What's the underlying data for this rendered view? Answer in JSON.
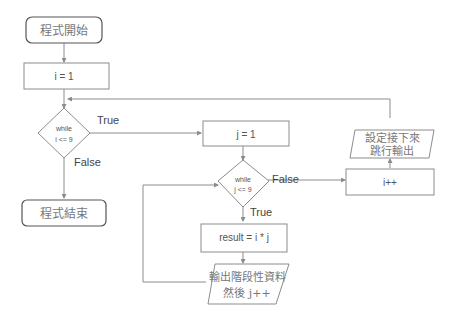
{
  "diagram": {
    "nodes": {
      "start": {
        "label": "程式開始",
        "shape": "rounded-rect"
      },
      "init_i": {
        "label": "i = 1",
        "shape": "rect"
      },
      "cond_i": {
        "line1": "while",
        "line2": "i <= 9",
        "shape": "diamond"
      },
      "end": {
        "label": "程式結束",
        "shape": "rounded-rect"
      },
      "init_j": {
        "label": "j = 1",
        "shape": "rect"
      },
      "cond_j": {
        "line1": "while",
        "line2": "j <= 9",
        "shape": "diamond"
      },
      "result": {
        "label": "result = i * j",
        "shape": "rect"
      },
      "output_j": {
        "line1": "輸出階段性資料",
        "line2": "然後 j++",
        "shape": "parallelogram"
      },
      "inc_i": {
        "label": "i++",
        "shape": "rect"
      },
      "output_i": {
        "line1": "設定接下來",
        "line2": "跳行輸出",
        "shape": "parallelogram"
      }
    },
    "edge_labels": {
      "cond_i_true": "True",
      "cond_i_false": "False",
      "cond_j_false": "False",
      "cond_j_true": "True"
    },
    "colors": {
      "stroke": "#8c8c8c",
      "text": "#555555"
    }
  }
}
